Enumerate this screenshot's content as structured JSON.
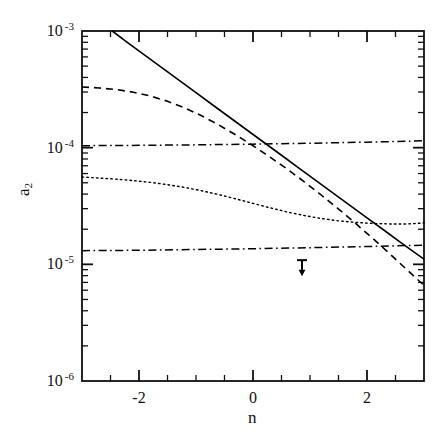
{
  "chart_data": {
    "type": "line",
    "title": "",
    "xlabel": "n",
    "ylabel": "a2",
    "ylabel_base": "a",
    "ylabel_sub": "2",
    "xlim": [
      -3,
      3
    ],
    "ylim": [
      1e-06,
      0.001
    ],
    "yscale": "log",
    "xscale": "linear",
    "grid": false,
    "legend": null,
    "xticks_major": [
      -2,
      0,
      2
    ],
    "xtick_labels": [
      "-2",
      "0",
      "2"
    ],
    "xticks_minor": [
      -2.5,
      -1.5,
      -1,
      -0.5,
      0.5,
      1,
      1.5,
      2.5
    ],
    "xtick_step_minor": 0.5,
    "yticks_major": [
      0.001,
      0.0001,
      1e-05,
      1e-06
    ],
    "ytick_labels": [
      {
        "mantissa": "10",
        "exponent": "-3"
      },
      {
        "mantissa": "10",
        "exponent": "-4"
      },
      {
        "mantissa": "10",
        "exponent": "-5"
      },
      {
        "mantissa": "10",
        "exponent": "-6"
      }
    ],
    "series": [
      {
        "name": "solid",
        "style": "solid",
        "color": "#000000",
        "width": 1.6,
        "points": [
          [
            -2.47,
            0.001
          ],
          [
            -2.2,
            0.000795
          ],
          [
            -1.9,
            0.000622
          ],
          [
            -1.6,
            0.000486
          ],
          [
            -1.3,
            0.00038
          ],
          [
            -1.0,
            0.000296
          ],
          [
            -0.7,
            0.000231
          ],
          [
            -0.4,
            0.0001805
          ],
          [
            -0.1,
            0.000141
          ],
          [
            0.2,
            0.0001102
          ],
          [
            0.5,
            8.61e-05
          ],
          [
            0.8,
            6.72e-05
          ],
          [
            1.1,
            5.25e-05
          ],
          [
            1.4,
            4.1e-05
          ],
          [
            1.7,
            3.2e-05
          ],
          [
            2.0,
            2.5e-05
          ],
          [
            2.3,
            1.96e-05
          ],
          [
            2.6,
            1.53e-05
          ],
          [
            2.9,
            1.2e-05
          ],
          [
            3.0,
            1.11e-05
          ]
        ]
      },
      {
        "name": "dashed",
        "style": "dashed",
        "color": "#000000",
        "width": 1.6,
        "points": [
          [
            -3.0,
            0.000331
          ],
          [
            -2.7,
            0.000325
          ],
          [
            -2.4,
            0.000315
          ],
          [
            -2.1,
            0.000299
          ],
          [
            -1.8,
            0.000277
          ],
          [
            -1.5,
            0.00025
          ],
          [
            -1.2,
            0.000219
          ],
          [
            -0.9,
            0.0001875
          ],
          [
            -0.6,
            0.0001565
          ],
          [
            -0.3,
            0.0001285
          ],
          [
            0.0,
            0.000104
          ],
          [
            0.3,
            8.3e-05
          ],
          [
            0.6,
            6.55e-05
          ],
          [
            0.9,
            5.1e-05
          ],
          [
            1.2,
            3.92e-05
          ],
          [
            1.5,
            2.98e-05
          ],
          [
            1.8,
            2.24e-05
          ],
          [
            2.1,
            1.67e-05
          ],
          [
            2.4,
            1.23e-05
          ],
          [
            2.7,
            9e-06
          ],
          [
            3.0,
            6.6e-06
          ]
        ]
      },
      {
        "name": "dotted",
        "style": "dotted",
        "color": "#000000",
        "width": 1.4,
        "points": [
          [
            -3.0,
            5.6e-05
          ],
          [
            -2.7,
            5.49e-05
          ],
          [
            -2.4,
            5.37e-05
          ],
          [
            -2.1,
            5.22e-05
          ],
          [
            -1.8,
            5.04e-05
          ],
          [
            -1.5,
            4.82e-05
          ],
          [
            -1.2,
            4.56e-05
          ],
          [
            -0.9,
            4.27e-05
          ],
          [
            -0.6,
            3.96e-05
          ],
          [
            -0.3,
            3.64e-05
          ],
          [
            0.0,
            3.33e-05
          ],
          [
            0.3,
            3.05e-05
          ],
          [
            0.6,
            2.81e-05
          ],
          [
            0.9,
            2.62e-05
          ],
          [
            1.2,
            2.47e-05
          ],
          [
            1.5,
            2.36e-05
          ],
          [
            1.8,
            2.29e-05
          ],
          [
            2.1,
            2.24e-05
          ],
          [
            2.4,
            2.22e-05
          ],
          [
            2.7,
            2.22e-05
          ],
          [
            3.0,
            2.26e-05
          ]
        ]
      },
      {
        "name": "dash-dot-upper",
        "style": "dashdot",
        "color": "#000000",
        "width": 1.5,
        "points": [
          [
            -3.0,
            0.000104
          ],
          [
            -2.0,
            0.0001047
          ],
          [
            -1.0,
            0.0001057
          ],
          [
            0.0,
            0.0001072
          ],
          [
            1.0,
            0.0001092
          ],
          [
            2.0,
            0.0001115
          ],
          [
            3.0,
            0.0001145
          ]
        ]
      },
      {
        "name": "dash-dot-lower",
        "style": "dashdot",
        "color": "#000000",
        "width": 1.5,
        "points": [
          [
            -3.0,
            1.31e-05
          ],
          [
            -2.0,
            1.32e-05
          ],
          [
            -1.0,
            1.34e-05
          ],
          [
            0.0,
            1.36e-05
          ],
          [
            1.0,
            1.39e-05
          ],
          [
            2.0,
            1.42e-05
          ],
          [
            3.0,
            1.46e-05
          ]
        ]
      }
    ],
    "annotations": [
      {
        "name": "upper-limit-arrow",
        "type": "upper_limit",
        "x": 0.86,
        "y": 8.4e-06,
        "color": "#000000"
      }
    ]
  }
}
